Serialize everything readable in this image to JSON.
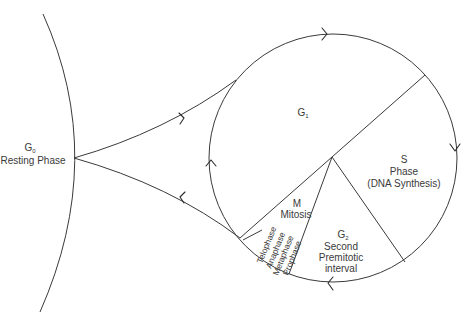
{
  "diagram": {
    "colors": {
      "line": "#3a3a3a",
      "text": "#3a3a3a",
      "background": "#ffffff"
    },
    "g0": {
      "symbol": "G",
      "subscript": "0",
      "name": "Resting Phase"
    },
    "g1": {
      "symbol": "G",
      "subscript": "1"
    },
    "s": {
      "line1": "S",
      "line2": "Phase",
      "line3": "(DNA Synthesis)"
    },
    "g2": {
      "symbol": "G",
      "subscript": "2",
      "line2": "Second",
      "line3": "Premitotic",
      "line4": "interval"
    },
    "m": {
      "line1": "M",
      "line2": "Mitosis",
      "subphases": [
        "Telophase",
        "Anaphase",
        "Metaphase",
        "Prophase"
      ]
    },
    "arrows": [
      {
        "name": "g0-to-g1",
        "direction": "right"
      },
      {
        "name": "g1-to-g0",
        "direction": "left"
      },
      {
        "name": "cycle-top",
        "direction": "right"
      },
      {
        "name": "cycle-right",
        "direction": "down"
      },
      {
        "name": "cycle-bottom",
        "direction": "left"
      },
      {
        "name": "cycle-left",
        "direction": "up"
      }
    ]
  }
}
